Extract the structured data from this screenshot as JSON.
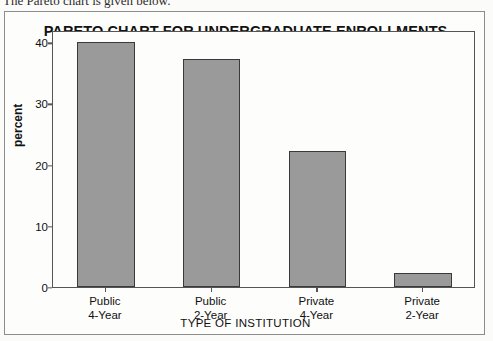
{
  "caption": {
    "text": "The Pareto chart is given below."
  },
  "chart_data": {
    "type": "bar",
    "title": "PARETO CHART FOR UNDERGRADUATE ENROLLMENTS",
    "xlabel": "TYPE OF INSTITUTION",
    "ylabel": "percent",
    "categories": [
      "Public\n4-Year",
      "Public\n2-Year",
      "Private\n4-Year",
      "Private\n2-Year"
    ],
    "category_lines": [
      [
        "Public",
        "4-Year"
      ],
      [
        "Public",
        "2-Year"
      ],
      [
        "Private",
        "4-Year"
      ],
      [
        "Private",
        "2-Year"
      ]
    ],
    "values": [
      40.0,
      37.2,
      22.2,
      2.3
    ],
    "ylim": [
      0,
      42
    ],
    "yticks": [
      0,
      10,
      20,
      30,
      40
    ],
    "ytick_labels": [
      "0",
      "10",
      "20",
      "30",
      "40"
    ],
    "grid": false,
    "legend": false,
    "bar_color": "#9a9a9a",
    "bar_edge_color": "#3a3a3a",
    "axis_color": "#555555",
    "background": "#fdfdfc"
  }
}
